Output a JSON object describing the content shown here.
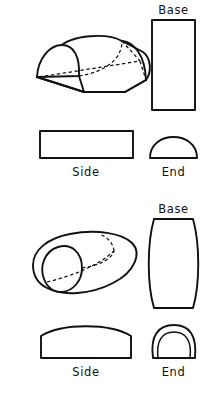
{
  "figure": {
    "background_color": "#ffffff",
    "ink_color": "#111111",
    "width": 216,
    "height": 394,
    "style": "line drawing, hand-lettered captions, hidden edges shown dashed"
  },
  "groups": [
    {
      "id": "upper",
      "name": "half-cylinder-loaf",
      "pictorial": {
        "name": "pictorial-half-cylinder",
        "description": "3/4 isometric view of a semicircular-section loaf (half cylinder) with flat rectangular base and rounded top, hidden edges dashed"
      },
      "views": [
        {
          "key": "base",
          "label": "Base",
          "shape": "rectangle",
          "description": "plain upright rectangle"
        },
        {
          "key": "side",
          "label": "Side",
          "shape": "rectangle",
          "description": "plain wide rectangle"
        },
        {
          "key": "end",
          "label": "End",
          "shape": "semicircle",
          "description": "semicircular dome on a flat base line"
        }
      ]
    },
    {
      "id": "lower",
      "name": "ovoid-loaf",
      "pictorial": {
        "name": "pictorial-ovoid-loaf",
        "description": "3/4 isometric view of an ovoid / bloomer loaf with rounded tapering body and a curved end face, hidden edges dashed"
      },
      "views": [
        {
          "key": "base",
          "label": "Base",
          "shape": "barrel",
          "description": "rectangle with outward-bowed left and right sides"
        },
        {
          "key": "side",
          "label": "Side",
          "shape": "domed-rectangle",
          "description": "rectangle with an upward-arched top edge"
        },
        {
          "key": "end",
          "label": "End",
          "shape": "nested-arch",
          "description": "rounded arch with a second concentric arch outline inside"
        }
      ]
    }
  ],
  "labels": {
    "upper_base": "Base",
    "upper_side": "Side",
    "upper_end": "End",
    "lower_base": "Base",
    "lower_side": "Side",
    "lower_end": "End"
  }
}
